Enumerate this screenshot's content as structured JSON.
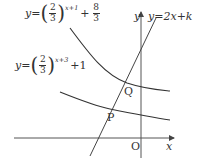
{
  "diagram": {
    "curve_upper": {
      "label_prefix": "y=",
      "base_num": "2",
      "base_den": "3",
      "exponent": "x+1",
      "plus": "+",
      "const_num": "8",
      "const_den": "3"
    },
    "curve_lower": {
      "label_prefix": "y=",
      "base_num": "2",
      "base_den": "3",
      "exponent": "x+3",
      "tail": "+1"
    },
    "line": {
      "label": "y=2x+k"
    },
    "axes": {
      "x_label": "x",
      "y_label": "y",
      "origin_label": "O"
    },
    "points": {
      "Q": "Q",
      "P": "P"
    },
    "colors": {
      "stroke": "#333333",
      "axis": "#555555"
    }
  }
}
